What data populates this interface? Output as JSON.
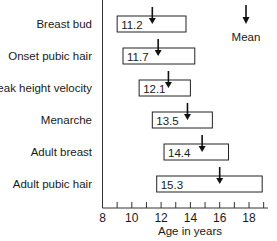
{
  "chart_data": {
    "type": "bar",
    "subtype": "horizontal-range",
    "title": "",
    "xlabel": "Age in years",
    "ylabel": "",
    "xlim": [
      8,
      19.5
    ],
    "xticks": [
      8,
      10,
      12,
      14,
      16,
      18
    ],
    "minor_ticks": [
      9,
      11,
      13,
      15,
      17,
      19
    ],
    "grid": false,
    "legend": {
      "label": "Mean",
      "symbol": "down-arrow",
      "position": "top-right"
    },
    "categories": [
      "Breast bud",
      "Onset pubic hair",
      "Peak height velocity",
      "Menarche",
      "Adult breast",
      "Adult pubic hair"
    ],
    "series": [
      {
        "name": "range_start",
        "values": [
          9.0,
          9.4,
          10.5,
          11.4,
          12.2,
          11.7
        ]
      },
      {
        "name": "range_end",
        "values": [
          13.7,
          14.3,
          14.0,
          15.5,
          16.6,
          18.9
        ]
      },
      {
        "name": "mean_label",
        "values": [
          11.2,
          11.7,
          12.1,
          13.5,
          14.4,
          15.3
        ]
      },
      {
        "name": "arrow_position",
        "values": [
          11.4,
          11.8,
          12.5,
          13.8,
          14.8,
          16.0
        ]
      }
    ]
  },
  "rows": [
    {
      "label": "Breast bud",
      "start": 9.0,
      "end": 13.7,
      "value": "11.2",
      "arrow": 11.4
    },
    {
      "label": "Onset pubic hair",
      "start": 9.4,
      "end": 14.3,
      "value": "11.7",
      "arrow": 11.8
    },
    {
      "label": "Peak height velocity",
      "start": 10.5,
      "end": 14.0,
      "value": "12.1",
      "arrow": 12.5
    },
    {
      "label": "Menarche",
      "start": 11.4,
      "end": 15.5,
      "value": "13.5",
      "arrow": 13.8
    },
    {
      "label": "Adult breast",
      "start": 12.2,
      "end": 16.6,
      "value": "14.4",
      "arrow": 14.8
    },
    {
      "label": "Adult pubic hair",
      "start": 11.7,
      "end": 18.9,
      "value": "15.3",
      "arrow": 16.0
    }
  ],
  "axis": {
    "label": "Age in years",
    "ticks": [
      "8",
      "10",
      "12",
      "14",
      "16",
      "18"
    ]
  },
  "legend": {
    "label": "Mean"
  }
}
